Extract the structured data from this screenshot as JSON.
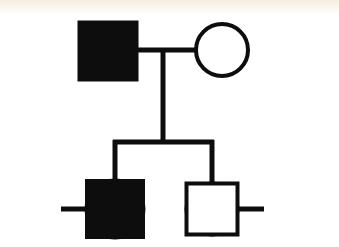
{
  "figure": {
    "kind": "pedigree-chart",
    "background_color": "#ffffff",
    "ink_color": "#0d0d0d",
    "scan_tint_color": "#f6efe2",
    "generation_count": 2,
    "legend": {
      "filled_meaning": "affected",
      "open_meaning": "unaffected",
      "square_meaning": "male",
      "circle_meaning": "female"
    }
  },
  "chart_data": {
    "type": "diagram",
    "subtype": "pedigree",
    "individuals": [
      {
        "id": "I-1",
        "generation": 1,
        "sex": "male",
        "shape": "square",
        "affected": true,
        "fill": "filled",
        "role": "father",
        "label": "",
        "cx": 108,
        "cy": 51,
        "size": 58
      },
      {
        "id": "I-2",
        "generation": 1,
        "sex": "female",
        "shape": "circle",
        "affected": false,
        "fill": "open",
        "role": "mother",
        "label": "",
        "cx": 222,
        "cy": 50,
        "size": 52
      },
      {
        "id": "II-1",
        "generation": 2,
        "sex": "female",
        "shape": "circle",
        "affected": false,
        "fill": "open",
        "role": "spouse-of-son",
        "label": "",
        "cx": 38,
        "cy": 209,
        "size": 50
      },
      {
        "id": "II-2",
        "generation": 2,
        "sex": "male",
        "shape": "square",
        "affected": true,
        "fill": "filled",
        "role": "son",
        "label": "",
        "cx": 115,
        "cy": 209,
        "size": 57
      },
      {
        "id": "II-3",
        "generation": 2,
        "sex": "female",
        "shape": "circle",
        "affected": false,
        "fill": "open",
        "role": "daughter",
        "label": "",
        "cx": 212,
        "cy": 209,
        "size": 51
      },
      {
        "id": "II-4",
        "generation": 2,
        "sex": "male",
        "shape": "square",
        "affected": false,
        "fill": "open",
        "role": "spouse-of-daughter",
        "label": "",
        "cx": 288,
        "cy": 209,
        "size": 53
      }
    ],
    "matings": [
      {
        "id": "mating-1",
        "partners": [
          "I-1",
          "I-2"
        ],
        "y": 50,
        "x1": 137,
        "x2": 196
      },
      {
        "id": "mating-2",
        "partners": [
          "II-1",
          "II-2"
        ],
        "y": 209,
        "x1": 63,
        "x2": 88
      },
      {
        "id": "mating-3",
        "partners": [
          "II-3",
          "II-4"
        ],
        "y": 209,
        "x1": 237,
        "x2": 262
      }
    ],
    "sibships": [
      {
        "id": "sibship-1",
        "parents": [
          "I-1",
          "I-2"
        ],
        "children": [
          "II-2",
          "II-3"
        ],
        "descender_x": 163,
        "descender_y1": 50,
        "descender_y2": 142,
        "bar_y": 142,
        "bar_x1": 115,
        "bar_x2": 212
      }
    ],
    "counts": {
      "total_individuals": 6,
      "affected_individuals": 2,
      "unaffected_individuals": 4,
      "males": 3,
      "females": 3,
      "matings": 3,
      "children": 2
    }
  },
  "geometry": {
    "canvas_width": 339,
    "canvas_height": 247,
    "stroke_width_shape": 4,
    "stroke_width_line": 5,
    "gen1_row_y": 50,
    "gen2_row_y": 209,
    "sibship_bar_y": 142
  }
}
